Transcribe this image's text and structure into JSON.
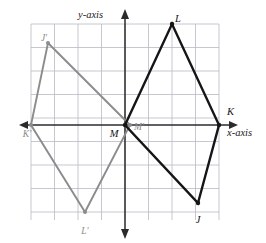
{
  "figure": {
    "kind": "coordinate-plane-geometry",
    "axes": {
      "x_label": "x-axis",
      "y_label": "y-axis"
    },
    "grid": {
      "cols": 8,
      "rows": 8,
      "cell_px": 23.5,
      "left_px": 31,
      "top_px": 24,
      "right_px": 219,
      "bottom_px": 220,
      "origin_px": [
        125,
        125
      ],
      "color": "#b9b9c4"
    },
    "colors": {
      "preimage": "#151515",
      "image": "#8c8c8c",
      "axis": "#2b2b2b",
      "grid": "#b9b9c4"
    },
    "shapes": [
      {
        "name": "quadrilateral-JKLM",
        "role": "preimage",
        "color": "#151515",
        "closed": true,
        "vertices": [
          {
            "label": "J",
            "grid": [
              3,
              -3.3
            ],
            "px": [
              198,
              203
            ],
            "label_px": [
              198,
              215
            ],
            "label_anchor": "middle"
          },
          {
            "label": "K",
            "grid": [
              4,
              0
            ],
            "px": [
              219,
              125
            ],
            "label_px": [
              227,
              107
            ],
            "label_anchor": "start"
          },
          {
            "label": "L",
            "grid": [
              2,
              4.3
            ],
            "px": [
              172,
              24
            ],
            "label_px": [
              175,
              14
            ],
            "label_anchor": "start"
          },
          {
            "label": "M",
            "grid": [
              0,
              0
            ],
            "px": [
              125,
              125
            ],
            "label_px": [
              114,
              129
            ],
            "label_anchor": "middle"
          }
        ]
      },
      {
        "name": "quadrilateral-J-prime-K-prime-L-prime-M-prime",
        "role": "image",
        "color": "#8c8c8c",
        "closed": true,
        "vertices": [
          {
            "label": "J'",
            "grid": [
              -3.3,
              3.5
            ],
            "px": [
              48,
              43
            ],
            "label_px": [
              44,
              34
            ],
            "label_anchor": "middle"
          },
          {
            "label": "K'",
            "grid": [
              -4,
              0
            ],
            "px": [
              31,
              125
            ],
            "label_px": [
              27,
              130
            ],
            "label_anchor": "middle"
          },
          {
            "label": "L'",
            "grid": [
              -1.7,
              -3.7
            ],
            "px": [
              85,
              212
            ],
            "label_px": [
              85,
              227
            ],
            "label_anchor": "middle"
          },
          {
            "label": "M'",
            "grid": [
              0.2,
              0
            ],
            "px": [
              130,
              125
            ],
            "label_px": [
              134,
              123
            ],
            "label_anchor": "start"
          }
        ]
      }
    ]
  }
}
